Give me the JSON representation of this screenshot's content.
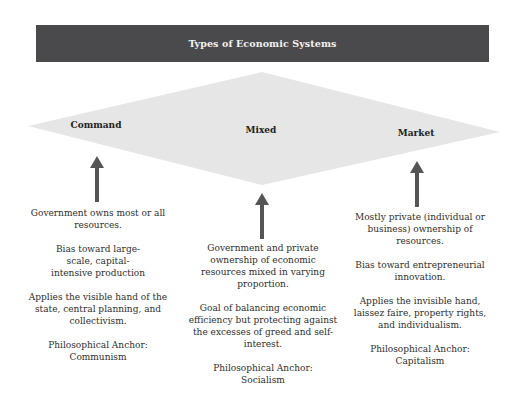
{
  "header": {
    "title": "Types of Economic Systems"
  },
  "colors": {
    "header_bg": "#4a4a4c",
    "header_text": "#f2f2f2",
    "diamond_fill": "#e6e6e6",
    "arrow": "#555555"
  },
  "systems": [
    {
      "name": "Command",
      "descriptions": [
        "Government owns most or all resources.",
        "Bias toward large-scale, capital-intensive production",
        "Applies the visible hand of the state, central planning, and collectivism.",
        "Philosophical Anchor: Communism"
      ]
    },
    {
      "name": "Mixed",
      "descriptions": [
        "Government and private ownership of economic resources mixed in varying proportion.",
        "Goal of balancing economic efficiency but protecting against the excesses of greed and self-interest.",
        "Philosophical Anchor: Socialism"
      ]
    },
    {
      "name": "Market",
      "descriptions": [
        "Mostly private (individual or business) ownership of resources.",
        "Bias toward entrepreneurial innovation.",
        "Applies the invisible hand, laissez faire, property rights, and individualism.",
        "Philosophical Anchor: Capitalism"
      ]
    }
  ]
}
